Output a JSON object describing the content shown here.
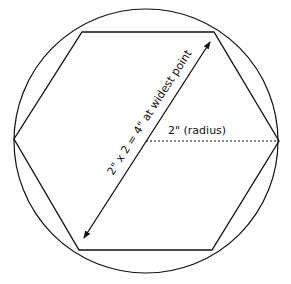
{
  "diagram": {
    "colors": {
      "stroke": "#111111",
      "background": "#ffffff"
    },
    "labels": {
      "diameter": "2\" x 2 = 4\" at widest point",
      "radius": "2\" (radius)"
    },
    "shapes": {
      "circle": {
        "cx": 146,
        "cy": 141,
        "r": 132
      },
      "hexagon_points": "82,32 214,32 279,141 212,250 79,250 14,139",
      "diameter_arrow": {
        "x1": 84,
        "y1": 238,
        "x2": 210,
        "y2": 42
      },
      "radius_line": {
        "x1": 146,
        "y1": 141,
        "x2": 278,
        "y2": 141
      }
    }
  }
}
